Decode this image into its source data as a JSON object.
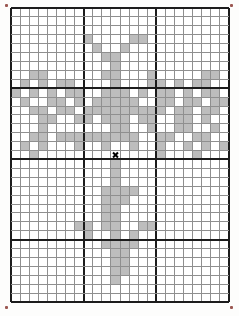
{
  "page": {
    "background": "#fdfdfc",
    "width": 239,
    "height": 316
  },
  "chart_data": {
    "type": "heatmap",
    "title": "",
    "xlabel": "",
    "ylabel": "",
    "grid": {
      "columns": 24,
      "rows": 33,
      "origin_x": 11,
      "origin_y": 8,
      "cell_width": 9.083,
      "cell_height": 8.909,
      "bold_columns": [
        0,
        8,
        16,
        24
      ],
      "bold_rows": [
        0,
        9,
        17,
        26,
        33
      ]
    },
    "colors": {
      "background": "#ffffff",
      "minor_line": "#8f8f8f",
      "bold_line": "#1c1c1c",
      "fill": "#bdbdbd",
      "marker": "#000000",
      "corner_mark": "#8a3a33"
    },
    "filled_cells_by_row": {
      "3": [
        8,
        13,
        14
      ],
      "4": [
        9,
        12
      ],
      "5": [
        10,
        11
      ],
      "6": [
        11
      ],
      "7": [
        2,
        3,
        10,
        11,
        15,
        21,
        22
      ],
      "8": [
        1,
        3,
        5,
        6,
        11,
        15,
        16,
        18,
        20,
        21
      ],
      "9": [
        0,
        2,
        4,
        6,
        7,
        10,
        11,
        12,
        14,
        16,
        17,
        19,
        21,
        22
      ],
      "10": [
        1,
        4,
        5,
        7,
        9,
        10,
        11,
        12,
        13,
        16,
        17,
        19,
        20,
        22,
        23
      ],
      "11": [
        2,
        3,
        5,
        6,
        8,
        9,
        10,
        11,
        12,
        13,
        14,
        15,
        16,
        18,
        19,
        21,
        22
      ],
      "12": [
        3,
        4,
        7,
        8,
        10,
        11,
        12,
        14,
        15,
        18,
        19,
        21
      ],
      "13": [
        3,
        11,
        12,
        15,
        18,
        19,
        22
      ],
      "14": [
        2,
        3,
        5,
        6,
        7,
        8,
        9,
        10,
        11,
        12,
        13,
        16,
        17,
        20,
        21
      ],
      "15": [
        1,
        3,
        7,
        10,
        13,
        16,
        19,
        21,
        23
      ],
      "16": [
        2,
        16,
        20
      ],
      "17": [
        11
      ],
      "18": [
        11
      ],
      "19": [
        11
      ],
      "20": [
        10,
        11,
        12,
        13
      ],
      "21": [
        10,
        11,
        12
      ],
      "22": [
        10,
        11
      ],
      "23": [
        10,
        11
      ],
      "24": [
        7,
        8,
        10,
        11,
        14,
        15
      ],
      "25": [
        8,
        11,
        13
      ],
      "26": [
        10,
        11,
        12,
        13
      ],
      "27": [
        11,
        12
      ],
      "28": [
        11,
        12
      ],
      "29": [
        11,
        12
      ],
      "30": [
        11
      ]
    },
    "center_marker": {
      "col": 11,
      "row": 16,
      "symbol": "x"
    },
    "corner_marks": [
      {
        "x": 5,
        "y": 4
      },
      {
        "x": 230,
        "y": 4
      },
      {
        "x": 5,
        "y": 306
      },
      {
        "x": 230,
        "y": 306
      }
    ]
  }
}
